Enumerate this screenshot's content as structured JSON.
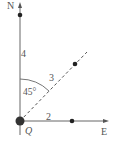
{
  "diagram": {
    "type": "vector-direction",
    "axes": {
      "north_label": "N",
      "east_label": "E",
      "origin_label": "Q"
    },
    "segments": [
      {
        "name": "north",
        "length_label": "4"
      },
      {
        "name": "northeast",
        "length_label": "3"
      },
      {
        "name": "east",
        "length_label": "2"
      }
    ],
    "angle": {
      "label": "45°",
      "between": [
        "north",
        "northeast"
      ]
    },
    "colors": {
      "line": "#555555",
      "point": "#222222",
      "origin": "#333333"
    }
  }
}
